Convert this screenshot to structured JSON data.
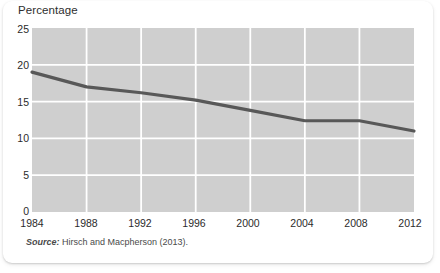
{
  "chart_data": {
    "type": "line",
    "title": "Percentage",
    "xlabel": "",
    "ylabel": "",
    "x": [
      1984,
      1988,
      1992,
      1996,
      2000,
      2004,
      2008,
      2012
    ],
    "values": [
      19.0,
      17.0,
      16.2,
      15.2,
      13.8,
      12.4,
      12.4,
      11.0
    ],
    "series": [
      {
        "name": "Percentage",
        "values": [
          19.0,
          17.0,
          16.2,
          15.2,
          13.8,
          12.4,
          12.4,
          11.0
        ]
      }
    ],
    "xlim": [
      1984,
      2012
    ],
    "ylim": [
      0,
      25
    ],
    "y_ticks": [
      0,
      5,
      10,
      15,
      20,
      25
    ],
    "x_ticks": [
      1984,
      1988,
      1992,
      1996,
      2000,
      2004,
      2008,
      2012
    ],
    "x_tick_labels": [
      "1984",
      "1988",
      "1992",
      "1996",
      "2000",
      "2004",
      "2008",
      "2012"
    ],
    "y_tick_labels": [
      "0",
      "5",
      "10",
      "15",
      "20",
      "25"
    ],
    "grid": true,
    "legend": false,
    "legend_position": "none",
    "plot_background_color": "#cfcfcf",
    "gridline_color": "#ffffff",
    "line_color": "#585858",
    "line_width": 3.2
  },
  "source": {
    "label": "Source:",
    "text": " Hirsch and Macpherson (2013)."
  }
}
